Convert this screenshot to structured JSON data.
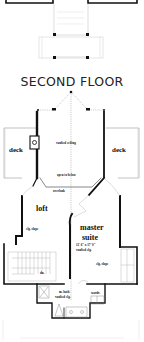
{
  "plan": {
    "title": "SECOND FLOOR",
    "rooms": {
      "deck_left": "deck",
      "deck_right": "deck",
      "loft": "loft",
      "master_suite_line1": "master",
      "master_suite_line2": "suite",
      "master_suite_dims": "11' 6\" x 17' 0\"",
      "master_suite_ceiling": "vaulted clg."
    },
    "notes": {
      "vaulted_ceiling": "vaulted ceiling",
      "open_to_below": "open to below",
      "overlook": "overlook",
      "clg_slope_loft": "clg. slope",
      "clg_slope_master": "clg. slope",
      "dn": "dn.",
      "m_bath_line1": "m. bath",
      "m_bath_line2": "vaulted clg.",
      "wardrobe": "wardr."
    },
    "colors": {
      "wall": "#111111",
      "thin_line": "#9a9a9a",
      "background": "#ffffff"
    }
  }
}
